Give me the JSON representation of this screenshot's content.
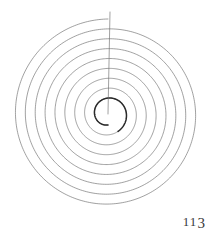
{
  "page": {
    "background_color": "#ffffff",
    "width": 215,
    "height": 237,
    "folio": "113",
    "folio_digits": [
      "1",
      "1",
      "3"
    ]
  },
  "figure": {
    "name": "archimedean-spiral",
    "caption": "",
    "stroke_color": "#6e6e6e",
    "inner_stroke_color": "#2a2a2a",
    "center_x": 108,
    "center_y": 114,
    "start_radius": 11,
    "end_radius": 95,
    "turns": 8.5,
    "radius_line_label": "",
    "radius_line_from_x": 110,
    "radius_line_from_y": 12,
    "radius_line_to_x": 108,
    "radius_line_to_y": 114
  },
  "chart_data": {
    "type": "line",
    "title": "",
    "xlabel": "",
    "ylabel": "",
    "parameters": {
      "a": 11,
      "b": 1.573,
      "theta_start_deg": 90,
      "theta_total_deg": 3060,
      "turns": 8.5
    },
    "polar_points_deg_r": [
      [
        90,
        11.0
      ],
      [
        180,
        13.5
      ],
      [
        270,
        16.0
      ],
      [
        360,
        18.5
      ],
      [
        450,
        21.0
      ],
      [
        540,
        23.4
      ],
      [
        630,
        25.9
      ],
      [
        720,
        28.4
      ],
      [
        810,
        30.9
      ],
      [
        900,
        33.4
      ],
      [
        990,
        35.8
      ],
      [
        1080,
        38.3
      ],
      [
        1170,
        40.8
      ],
      [
        1260,
        43.3
      ],
      [
        1350,
        45.8
      ],
      [
        1440,
        48.2
      ],
      [
        1530,
        50.7
      ],
      [
        1620,
        53.2
      ],
      [
        1710,
        55.7
      ],
      [
        1800,
        58.2
      ],
      [
        1890,
        60.6
      ],
      [
        1980,
        63.1
      ],
      [
        2070,
        65.6
      ],
      [
        2160,
        68.1
      ],
      [
        2250,
        70.6
      ],
      [
        2340,
        73.0
      ],
      [
        2430,
        75.5
      ],
      [
        2520,
        78.0
      ],
      [
        2610,
        80.5
      ],
      [
        2700,
        83.0
      ],
      [
        2790,
        85.4
      ],
      [
        2880,
        87.9
      ],
      [
        2970,
        90.4
      ],
      [
        3060,
        92.9
      ],
      [
        3150,
        95.0
      ]
    ],
    "grid": false,
    "legend": false
  }
}
